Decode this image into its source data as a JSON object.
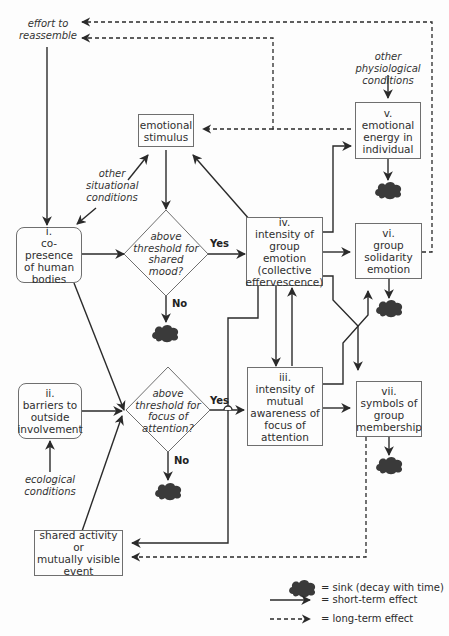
{
  "diagram": {
    "nodes": {
      "effort": {
        "lines": [
          "effort to",
          "reassemble"
        ]
      },
      "emotional_stimulus": {
        "lines": [
          "emotional",
          "stimulus"
        ]
      },
      "other_situational": {
        "lines": [
          "other",
          "situational",
          "conditions"
        ]
      },
      "co_presence": {
        "numeral": "i.",
        "lines": [
          "co-presence",
          "of human",
          "bodies"
        ]
      },
      "shared_mood": {
        "lines": [
          "above",
          "threshold for",
          "shared",
          "mood?"
        ]
      },
      "group_emotion": {
        "numeral": "iv.",
        "lines": [
          "intensity of",
          "group emotion",
          "(collective",
          "effervescence)"
        ]
      },
      "other_physiological": {
        "lines": [
          "other physiological",
          "conditions"
        ]
      },
      "emotional_energy": {
        "numeral": "v.",
        "lines": [
          "emotional",
          "energy in",
          "individual"
        ]
      },
      "group_solidarity": {
        "numeral": "vi.",
        "lines": [
          "group",
          "solidarity",
          "emotion"
        ]
      },
      "barriers": {
        "numeral": "ii.",
        "lines": [
          "barriers to",
          "outside",
          "involvement"
        ]
      },
      "focus_attention": {
        "lines": [
          "above",
          "threshold for",
          "focus of",
          "attention?"
        ]
      },
      "mutual_awareness": {
        "numeral": "iii.",
        "lines": [
          "intensity of",
          "mutual",
          "awareness of",
          "focus of",
          "attention"
        ]
      },
      "symbols": {
        "numeral": "vii.",
        "lines": [
          "symbols of",
          "group",
          "membership"
        ]
      },
      "ecological": {
        "lines": [
          "ecological",
          "conditions"
        ]
      },
      "shared_activity": {
        "lines": [
          "shared activity or",
          "mutually visible",
          "event"
        ]
      }
    },
    "decision_labels": {
      "yes": "Yes",
      "no": "No"
    },
    "legend": {
      "sink": "= sink (decay with time)",
      "short_term": "= short-term effect",
      "long_term": "= long-term effect"
    },
    "colors": {
      "line": "#2a2a2a",
      "box_border": "#6f6f6f",
      "sink": "#3a3a3a",
      "background": "#fdfdfd"
    }
  }
}
